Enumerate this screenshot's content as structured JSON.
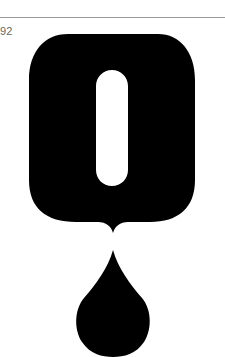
{
  "page": {
    "number": "92"
  },
  "artwork": {
    "description": "Black rounded letter O with a vertical slot, dripping a single drop",
    "fill_color": "#000000",
    "background_color": "#ffffff"
  }
}
